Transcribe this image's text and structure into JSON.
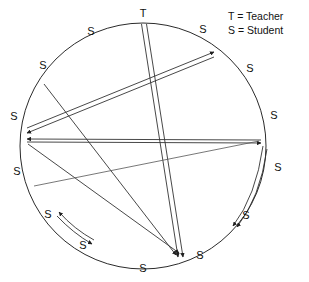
{
  "figure": {
    "type": "sociogram",
    "background_color": "#ffffff",
    "stroke_color": "#333333",
    "text_color": "#111111"
  },
  "legend": {
    "items": [
      {
        "key": "T",
        "separator": "=",
        "label": "Teacher",
        "text": "T = Teacher"
      },
      {
        "key": "S",
        "separator": "=",
        "label": "Student",
        "text": "S = Student"
      }
    ],
    "position": "top-right"
  },
  "circle": {
    "center_x": 143,
    "center_y": 146,
    "radius": 123
  },
  "nodes": [
    {
      "id": "n0",
      "label": "T",
      "role": "Teacher",
      "angle_deg": 270,
      "x": 143,
      "y": 18,
      "label_x": 143,
      "label_y": 14
    },
    {
      "id": "n1",
      "label": "S",
      "role": "Student",
      "angle_deg": 308,
      "x": 219,
      "y": 49,
      "label_x": 203,
      "label_y": 30
    },
    {
      "id": "n2",
      "label": "S",
      "role": "Student",
      "angle_deg": 338,
      "x": 257,
      "y": 100,
      "label_x": 250,
      "label_y": 69
    },
    {
      "id": "n3",
      "label": "S",
      "role": "Student",
      "angle_deg": 2,
      "x": 266,
      "y": 142,
      "label_x": 273,
      "label_y": 116
    },
    {
      "id": "n4",
      "label": "S",
      "role": "Student",
      "angle_deg": 28,
      "x": 252,
      "y": 200,
      "label_x": 277,
      "label_y": 168
    },
    {
      "id": "n5",
      "label": "S",
      "role": "Student",
      "angle_deg": 50,
      "x": 222,
      "y": 240,
      "label_x": 245,
      "label_y": 216
    },
    {
      "id": "n6",
      "label": "S",
      "role": "Student",
      "angle_deg": 72,
      "x": 181,
      "y": 263,
      "label_x": 199,
      "label_y": 255
    },
    {
      "id": "n7",
      "label": "S",
      "role": "Student",
      "angle_deg": 96,
      "x": 130,
      "y": 268,
      "label_x": 143,
      "label_y": 268
    },
    {
      "id": "n8",
      "label": "S",
      "role": "Student",
      "angle_deg": 122,
      "x": 78,
      "y": 250,
      "label_x": 83,
      "label_y": 245
    },
    {
      "id": "n9",
      "label": "S",
      "role": "Student",
      "angle_deg": 146,
      "x": 41,
      "y": 215,
      "label_x": 48,
      "label_y": 214
    },
    {
      "id": "n10",
      "label": "S",
      "role": "Student",
      "angle_deg": 178,
      "x": 20,
      "y": 150,
      "label_x": 17,
      "label_y": 171
    },
    {
      "id": "n11",
      "label": "S",
      "role": "Student",
      "angle_deg": 184,
      "x": 21,
      "y": 132,
      "label_x": 14,
      "label_y": 116
    },
    {
      "id": "n12",
      "label": "S",
      "role": "Student",
      "angle_deg": 212,
      "x": 40,
      "y": 81,
      "label_x": 43,
      "label_y": 65
    },
    {
      "id": "n13",
      "label": "S",
      "role": "Student",
      "angle_deg": 240,
      "x": 82,
      "y": 40,
      "label_x": 91,
      "label_y": 31
    }
  ],
  "edges": [
    {
      "from": "n0",
      "to": "n6",
      "direction": "both",
      "style": "double",
      "note": "teacher-to-bottom-right-student"
    },
    {
      "from": "n11",
      "to": "n2",
      "direction": "both",
      "style": "double",
      "note": "left-to-upper-right"
    },
    {
      "from": "n11",
      "to": "n3",
      "direction": "both",
      "style": "single",
      "note": "left-to-right horizontal"
    },
    {
      "from": "n12",
      "to": "n6",
      "direction": "to",
      "style": "single",
      "note": "upper-left to bottom-right"
    },
    {
      "from": "n3",
      "to": "n11",
      "direction": "to",
      "style": "single",
      "note": "right to left"
    },
    {
      "from": "n11",
      "to": "n5",
      "direction": "to",
      "style": "single",
      "note": "left to lower-right"
    },
    {
      "from": "n10",
      "to": "n3",
      "direction": "to",
      "style": "single",
      "note": "lower-left to right"
    },
    {
      "from": "n3",
      "to": "n4",
      "direction": "both",
      "style": "double",
      "note": "right pair curved"
    },
    {
      "from": "n8",
      "to": "n9",
      "direction": "both",
      "style": "double",
      "note": "bottom-left pair curved"
    }
  ],
  "counts": {
    "nodes_total": 14,
    "teachers": 1,
    "students": 13
  }
}
